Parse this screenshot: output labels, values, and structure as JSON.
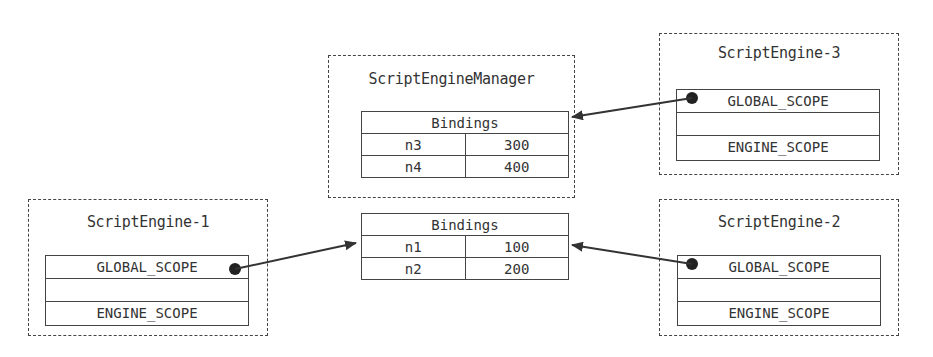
{
  "manager": {
    "title": "ScriptEngineManager",
    "bindings": {
      "header": "Bindings",
      "rows": [
        {
          "name": "n3",
          "value": "300"
        },
        {
          "name": "n4",
          "value": "400"
        }
      ]
    }
  },
  "shared_bindings": {
    "header": "Bindings",
    "rows": [
      {
        "name": "n1",
        "value": "100"
      },
      {
        "name": "n2",
        "value": "200"
      }
    ]
  },
  "engines": [
    {
      "title": "ScriptEngine-1",
      "global_scope": "GLOBAL_SCOPE",
      "engine_scope": "ENGINE_SCOPE"
    },
    {
      "title": "ScriptEngine-2",
      "global_scope": "GLOBAL_SCOPE",
      "engine_scope": "ENGINE_SCOPE"
    },
    {
      "title": "ScriptEngine-3",
      "global_scope": "GLOBAL_SCOPE",
      "engine_scope": "ENGINE_SCOPE"
    }
  ],
  "colors": {
    "line": "#333333",
    "border": "#444444",
    "background": "#ffffff"
  }
}
